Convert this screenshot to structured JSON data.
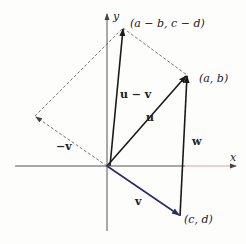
{
  "diagram": {
    "axes": {
      "x_label": "x",
      "y_label": "y",
      "origin": [
        107,
        166
      ],
      "x_end": [
        236,
        166
      ],
      "x_start": [
        15,
        166
      ],
      "y_end": [
        107,
        14
      ],
      "y_start": [
        107,
        231
      ]
    },
    "points": {
      "ab": {
        "label": "(a, b)",
        "pos": [
          187,
          75
        ]
      },
      "cd": {
        "label": "(c, d)",
        "pos": [
          180,
          216
        ]
      },
      "amb_cmd": {
        "label": "(a − b, c − d)",
        "pos": [
          123,
          28
        ]
      },
      "neg_v": {
        "pos": [
          35,
          116
        ]
      }
    },
    "vectors": {
      "u": {
        "label": "u",
        "label_pos": [
          146,
          120
        ]
      },
      "v": {
        "label": "v",
        "label_pos": [
          135,
          205
        ]
      },
      "neg_v": {
        "label": "−v",
        "label_pos": [
          60,
          146
        ]
      },
      "u_minus_v": {
        "label": "u − v",
        "label_pos": [
          120,
          98
        ]
      },
      "w": {
        "label": "w",
        "label_pos": [
          192,
          143
        ]
      }
    },
    "colors": {
      "vector": "#1a1a1a",
      "v_vector": "#2a2a6a",
      "axis": "#444444",
      "x_axis_highlight": "#e0a0a8",
      "dashed": "#555555"
    }
  }
}
